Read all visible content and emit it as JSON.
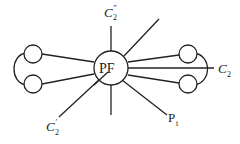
{
  "diagram": {
    "center_node": {
      "label": "PF"
    },
    "labels": {
      "top": "C",
      "top_sub": "2",
      "top_prime": "″",
      "bottom_left": "C",
      "bottom_left_sub": "2",
      "bottom_left_prime": "′",
      "right": "C",
      "right_sub": "2",
      "bottom_right": "P",
      "bottom_right_sub": "t"
    },
    "colors": {
      "stroke": "#222222",
      "background": "#ffffff"
    }
  }
}
